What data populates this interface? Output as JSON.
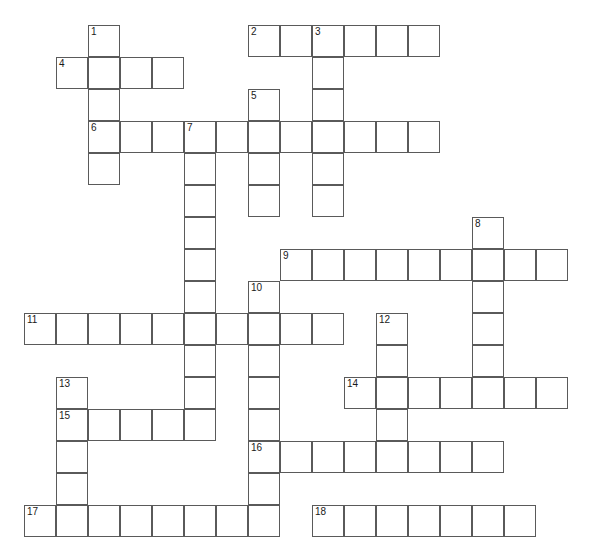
{
  "puzzle": {
    "title": "Crossword Grid",
    "type": "crossword",
    "geometry": {
      "cell_size": 32,
      "origin_x": 24,
      "origin_y": 25,
      "columns": 18,
      "rows": 16,
      "border_color": "#5a5a5a",
      "cell_fill": "#ffffff",
      "page_background": "#ffffff",
      "number_color": "#1a1a1a",
      "number_font_size": 10
    },
    "entries": [
      {
        "number": "1",
        "direction": "down",
        "col": 2,
        "row": 0,
        "length": 5
      },
      {
        "number": "2",
        "direction": "across",
        "col": 7,
        "row": 0,
        "length": 6
      },
      {
        "number": "3",
        "direction": "down",
        "col": 9,
        "row": 0,
        "length": 6
      },
      {
        "number": "4",
        "direction": "across",
        "col": 1,
        "row": 1,
        "length": 4
      },
      {
        "number": "5",
        "direction": "down",
        "col": 7,
        "row": 2,
        "length": 4
      },
      {
        "number": "6",
        "direction": "across",
        "col": 2,
        "row": 3,
        "length": 11
      },
      {
        "number": "7",
        "direction": "down",
        "col": 5,
        "row": 3,
        "length": 9
      },
      {
        "number": "8",
        "direction": "down",
        "col": 14,
        "row": 6,
        "length": 5
      },
      {
        "number": "9",
        "direction": "across",
        "col": 8,
        "row": 7,
        "length": 9
      },
      {
        "number": "10",
        "direction": "down",
        "col": 7,
        "row": 8,
        "length": 7
      },
      {
        "number": "11",
        "direction": "across",
        "col": 0,
        "row": 9,
        "length": 10
      },
      {
        "number": "12",
        "direction": "down",
        "col": 11,
        "row": 9,
        "length": 4
      },
      {
        "number": "13",
        "direction": "down",
        "col": 1,
        "row": 11,
        "length": 5
      },
      {
        "number": "14",
        "direction": "across",
        "col": 10,
        "row": 11,
        "length": 7
      },
      {
        "number": "15",
        "direction": "across",
        "col": 1,
        "row": 12,
        "length": 5
      },
      {
        "number": "16",
        "direction": "across",
        "col": 7,
        "row": 13,
        "length": 8
      },
      {
        "number": "17",
        "direction": "across",
        "col": 0,
        "row": 15,
        "length": 8
      },
      {
        "number": "18",
        "direction": "across",
        "col": 9,
        "row": 15,
        "length": 7
      }
    ]
  }
}
